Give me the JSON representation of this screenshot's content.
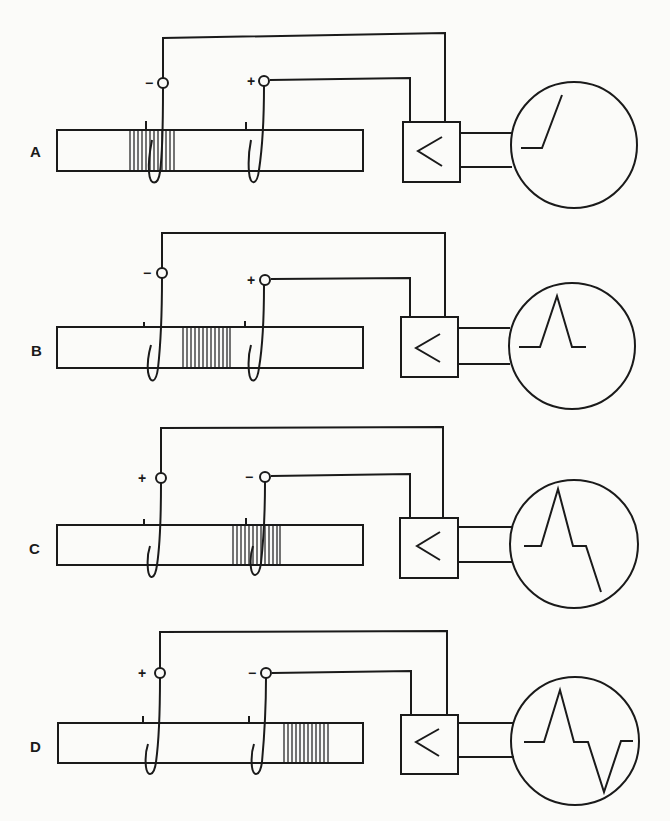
{
  "figure": {
    "colors": {
      "ink": "#1a1a1a",
      "paper": "#fbfbf9"
    },
    "panels": [
      {
        "label": "A",
        "electrode_left_sign": "−",
        "electrode_right_sign": "+",
        "impulse_position": "at left electrode",
        "trace": "monophasic rising edge"
      },
      {
        "label": "B",
        "electrode_left_sign": "−",
        "electrode_right_sign": "+",
        "impulse_position": "between electrodes",
        "trace": "positive peak"
      },
      {
        "label": "C",
        "electrode_left_sign": "+",
        "electrode_right_sign": "−",
        "impulse_position": "at right electrode",
        "trace": "positive peak then descending"
      },
      {
        "label": "D",
        "electrode_left_sign": "+",
        "electrode_right_sign": "−",
        "impulse_position": "past right electrode",
        "trace": "biphasic: positive then negative peak"
      }
    ],
    "amplifier_symbol": "<"
  }
}
